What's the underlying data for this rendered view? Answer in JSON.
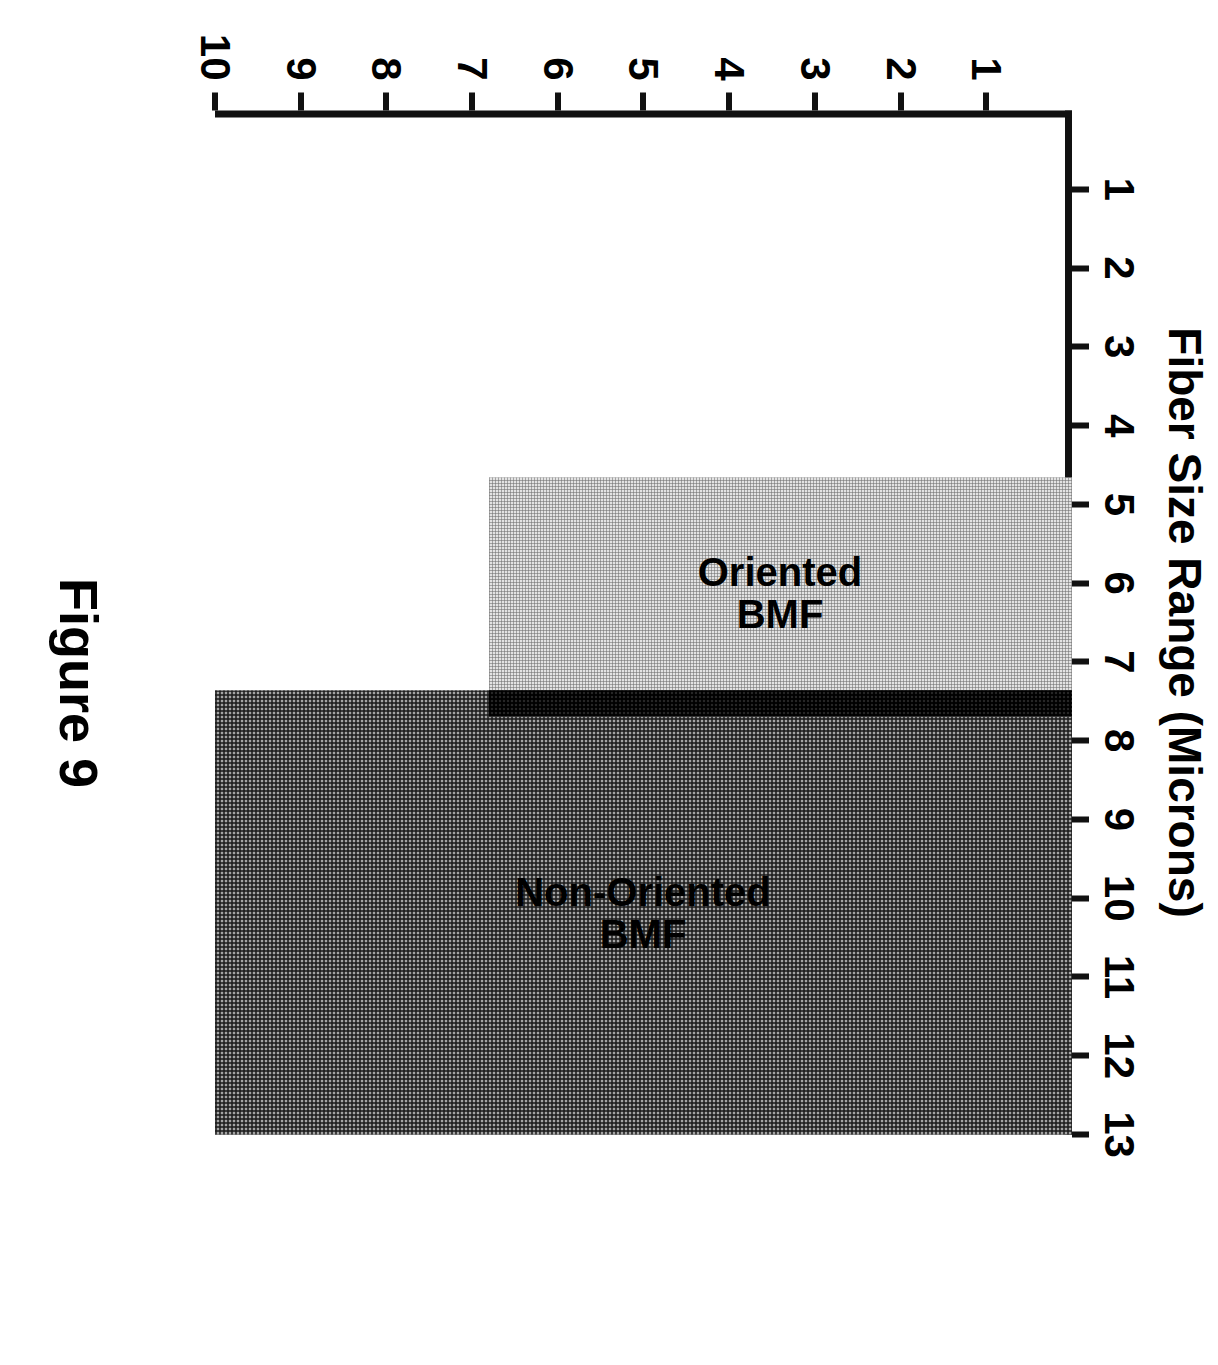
{
  "figure": {
    "caption": "Figure 9",
    "axis_title": "Fiber Size Range (Microns)",
    "size_axis_ticks": [
      "1",
      "2",
      "3",
      "4",
      "5",
      "6",
      "7",
      "8",
      "9",
      "10",
      "11",
      "12",
      "13"
    ],
    "count_axis_ticks": [
      "1",
      "2",
      "3",
      "4",
      "5",
      "6",
      "7",
      "8",
      "9",
      "10"
    ],
    "bars": [
      {
        "label": "Oriented\nBMF",
        "fill": "light"
      },
      {
        "label": "Non-Oriented\nBMF",
        "fill": "mid"
      }
    ]
  },
  "chart_data": {
    "type": "bar",
    "title": "Figure 9",
    "orientation": "horizontal",
    "xlabel": "",
    "ylabel": "Fiber Size Range (Microns)",
    "categories": [
      "Oriented BMF",
      "Non-Oriented BMF"
    ],
    "ranges": [
      {
        "name": "Oriented BMF",
        "size_min": 5.3,
        "size_max": 8.0,
        "value": 6.8,
        "fill_color": "#e3e3e3"
      },
      {
        "name": "Non-Oriented BMF",
        "size_min": 7.8,
        "size_max": 13.0,
        "value": 10.0,
        "fill_color": "#a4a4a4"
      }
    ],
    "overlap_band": {
      "size_min": 7.8,
      "size_max": 8.1,
      "value": 6.8,
      "fill_color": "#262626"
    },
    "size_axis": {
      "label": "Fiber Size Range (Microns)",
      "min": 1,
      "max": 13,
      "ticks": [
        1,
        2,
        3,
        4,
        5,
        6,
        7,
        8,
        9,
        10,
        11,
        12,
        13
      ]
    },
    "value_axis": {
      "label": "",
      "min": 0,
      "max": 10,
      "ticks": [
        1,
        2,
        3,
        4,
        5,
        6,
        7,
        8,
        9,
        10
      ]
    },
    "grid": false,
    "legend": "inline-labels"
  }
}
